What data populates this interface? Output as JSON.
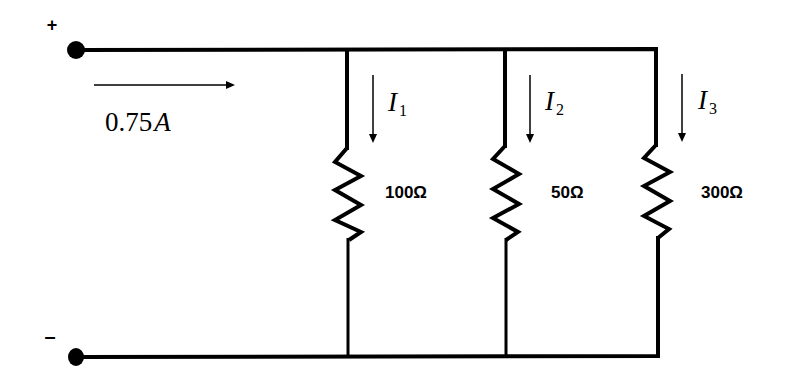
{
  "diagram": {
    "terminals": {
      "positive": {
        "sign": "+"
      },
      "negative": {
        "sign": "–"
      }
    },
    "source_current": {
      "value_number": "0.75",
      "value_unit": "A",
      "direction": "right"
    },
    "branches": [
      {
        "current_symbol": "I",
        "current_subscript": "1",
        "resistance": "100Ω"
      },
      {
        "current_symbol": "I",
        "current_subscript": "2",
        "resistance": "50Ω"
      },
      {
        "current_symbol": "I",
        "current_subscript": "3",
        "resistance": "300Ω"
      }
    ],
    "colors": {
      "stroke": "#000000",
      "background": "#ffffff"
    }
  }
}
